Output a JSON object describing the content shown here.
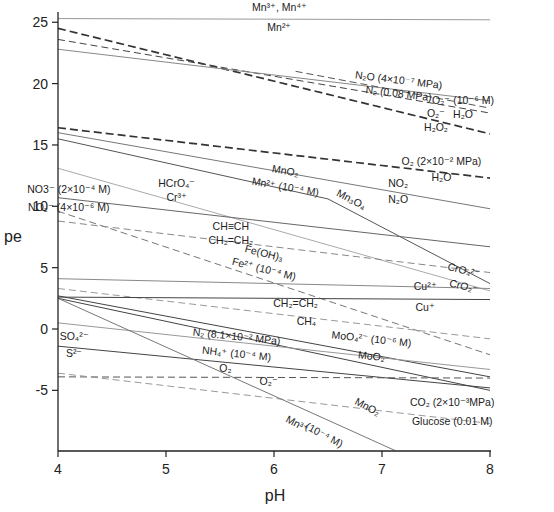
{
  "chart_data": {
    "type": "line",
    "title": "",
    "xlabel": "pH",
    "ylabel": "pe",
    "xlim": [
      4,
      8
    ],
    "ylim": [
      -9.9,
      25.8
    ],
    "xticks": [
      4,
      5,
      6,
      7,
      8
    ],
    "yticks": [
      -5,
      0,
      5,
      10,
      15,
      20,
      25
    ],
    "grid": false,
    "legend": "none (inline labels)",
    "series": [
      {
        "name": "Mn3+, Mn4+ / Mn2+",
        "style": "solid",
        "color": "#999999",
        "points": [
          [
            4,
            25.3
          ],
          [
            8,
            25.2
          ]
        ]
      },
      {
        "name": "O2 / H2O2",
        "style": "dash-thick",
        "color": "#333333",
        "points": [
          [
            4,
            24.5
          ],
          [
            8,
            15.9
          ]
        ]
      },
      {
        "name": "N2 (0.08 MPa)",
        "style": "dash",
        "color": "#444444",
        "points": [
          [
            4,
            23.6
          ],
          [
            8,
            17.6
          ]
        ]
      },
      {
        "name": "N2O (4x10^-7 MPa)",
        "style": "solid",
        "color": "#888888",
        "points": [
          [
            4,
            22.8
          ],
          [
            8,
            18.6
          ]
        ]
      },
      {
        "name": "O2- (10^-6 M) / H2O",
        "style": "dash",
        "color": "#555555",
        "points": [
          [
            6.2,
            21.0
          ],
          [
            8,
            18.0
          ]
        ]
      },
      {
        "name": "O2 (2x10^-2 MPa) / H2O",
        "style": "dash-thick",
        "color": "#333333",
        "points": [
          [
            4,
            16.4
          ],
          [
            8,
            12.3
          ]
        ]
      },
      {
        "name": "NO2 / N2O",
        "style": "solid",
        "color": "#777777",
        "points": [
          [
            4,
            16.0
          ],
          [
            8,
            9.8
          ]
        ]
      },
      {
        "name": "MnO2 / Mn2+ (10^-4 M)",
        "style": "solid",
        "color": "#555555",
        "points": [
          [
            4,
            15.5
          ],
          [
            6.5,
            10.6
          ]
        ]
      },
      {
        "name": "Mn3O4",
        "style": "solid",
        "color": "#555555",
        "points": [
          [
            6.5,
            10.6
          ],
          [
            8,
            3.7
          ]
        ]
      },
      {
        "name": "HCrO4- / Cr3+",
        "style": "solid",
        "color": "#aaaaaa",
        "points": [
          [
            4,
            13.1
          ],
          [
            8,
            3.1
          ]
        ]
      },
      {
        "name": "NO3- (2x10^-4 M)",
        "style": "solid",
        "color": "#666666",
        "points": [
          [
            4,
            10.7
          ],
          [
            8,
            6.7
          ]
        ]
      },
      {
        "name": "NO2- (4x10^-6 M)",
        "style": "dash",
        "color": "#777777",
        "points": [
          [
            4,
            9.6
          ],
          [
            8,
            -2.1
          ]
        ]
      },
      {
        "name": "CH≡CH / CH2=CH2",
        "style": "dash",
        "color": "#888888",
        "points": [
          [
            4,
            8.8
          ],
          [
            8,
            4.6
          ]
        ]
      },
      {
        "name": "CrO4 2- / CrO2-",
        "style": "solid",
        "color": "#888888",
        "points": [
          [
            4,
            4.1
          ],
          [
            8,
            3.3
          ]
        ]
      },
      {
        "name": "Fe(OH)3 / Fe2+ (10^-4 M)",
        "style": "dash",
        "color": "#999999",
        "points": [
          [
            4,
            3.3
          ],
          [
            8,
            -0.8
          ]
        ]
      },
      {
        "name": "Cu2+ / Cu+",
        "style": "solid",
        "color": "#444444",
        "points": [
          [
            4,
            2.6
          ],
          [
            8,
            2.4
          ]
        ]
      },
      {
        "name": "CH2=CH2 / CH4",
        "style": "solid",
        "color": "#444444",
        "points": [
          [
            4,
            2.7
          ],
          [
            8,
            -3.9
          ]
        ]
      },
      {
        "name": "MoO4 2- (10^-6 M) / MoO2",
        "style": "solid",
        "color": "#444444",
        "points": [
          [
            4,
            2.5
          ],
          [
            8,
            -5.0
          ]
        ]
      },
      {
        "name": "N2 (8.1x10^-2 MPa) / NH4+ (10^-4 M)",
        "style": "solid",
        "color": "#999999",
        "points": [
          [
            4,
            0.5
          ],
          [
            8,
            -3.3
          ]
        ]
      },
      {
        "name": "SO4 2- / S2-",
        "style": "solid",
        "color": "#444444",
        "points": [
          [
            4,
            -1.4
          ],
          [
            8,
            -4.8
          ]
        ]
      },
      {
        "name": "O2 / O2-",
        "style": "dash",
        "color": "#555555",
        "points": [
          [
            4,
            -3.9
          ],
          [
            8,
            -4.0
          ]
        ]
      },
      {
        "name": "CO2 (2x10^-3 MPa) / Glucose (0.01 M)",
        "style": "dash",
        "color": "#999999",
        "points": [
          [
            4,
            -3.6
          ],
          [
            8,
            -7.7
          ]
        ]
      },
      {
        "name": "MnO2 / Mn3+ (10^-4 M)",
        "style": "solid",
        "color": "#777777",
        "points": [
          [
            4,
            2.5
          ],
          [
            7.12,
            -9.9
          ]
        ]
      }
    ],
    "annotations": [
      {
        "text": "Mn³⁺, Mn⁴⁺",
        "x": 6.05,
        "y": 25.9
      },
      {
        "text": "Mn²⁺",
        "x": 6.05,
        "y": 24.3
      },
      {
        "text": "N₂O (4×10⁻⁷ MPa)",
        "x": 7.15,
        "y": 20.0,
        "rot": 7
      },
      {
        "text": "N₂ (0.08 MPa)",
        "x": 7.15,
        "y": 18.9,
        "rot": 7
      },
      {
        "text": "O₂⁻ (10⁻⁶ M)",
        "x": 7.75,
        "y": 18.3
      },
      {
        "text": "H₂O",
        "x": 7.75,
        "y": 17.2
      },
      {
        "text": "O₂⁻",
        "x": 7.5,
        "y": 17.3
      },
      {
        "text": "H₂O₂",
        "x": 7.5,
        "y": 16.1
      },
      {
        "text": "O₂ (2×10⁻² MPa)",
        "x": 7.55,
        "y": 13.4
      },
      {
        "text": "H₂O",
        "x": 7.55,
        "y": 12.1
      },
      {
        "text": "NO₂",
        "x": 7.15,
        "y": 11.6
      },
      {
        "text": "N₂O",
        "x": 7.15,
        "y": 10.3
      },
      {
        "text": "MnO₂",
        "x": 6.1,
        "y": 12.6,
        "rot": 10
      },
      {
        "text": "Mn²⁺ (10⁻⁴ M)",
        "x": 6.1,
        "y": 11.3,
        "rot": 10
      },
      {
        "text": "Mn₃O₄",
        "x": 6.7,
        "y": 10.3,
        "rot": 28
      },
      {
        "text": "HCrO₄⁻",
        "x": 5.1,
        "y": 11.6
      },
      {
        "text": "Cr³⁺",
        "x": 5.1,
        "y": 10.4
      },
      {
        "text": "NO3⁻ (2×10⁻⁴ M)",
        "x": 4.1,
        "y": 11.1
      },
      {
        "text": "NO₂⁻ (4×10⁻⁶ M)",
        "x": 4.1,
        "y": 9.6
      },
      {
        "text": "CH≡CH",
        "x": 5.6,
        "y": 8.1
      },
      {
        "text": "CH₂=CH₂",
        "x": 5.6,
        "y": 6.9
      },
      {
        "text": "Fe(OH)₃",
        "x": 5.9,
        "y": 5.9,
        "rot": 14
      },
      {
        "text": "Fe²⁺ (10⁻⁴ M)",
        "x": 5.9,
        "y": 4.6,
        "rot": 14
      },
      {
        "text": "CrO₄²⁻",
        "x": 7.75,
        "y": 4.5,
        "rot": 14
      },
      {
        "text": "CrO₂⁻",
        "x": 7.75,
        "y": 3.2,
        "rot": 14
      },
      {
        "text": "Cu²⁺",
        "x": 7.4,
        "y": 3.2
      },
      {
        "text": "Cu⁺",
        "x": 7.4,
        "y": 1.5
      },
      {
        "text": "CH₂=CH₂",
        "x": 6.2,
        "y": 1.8
      },
      {
        "text": "CH₄",
        "x": 6.3,
        "y": 0.3
      },
      {
        "text": "N₂ (8.1×10⁻² MPa)",
        "x": 5.65,
        "y": -0.9,
        "rot": 6
      },
      {
        "text": "NH₄⁺ (10⁻⁴ M)",
        "x": 5.65,
        "y": -2.3,
        "rot": 6
      },
      {
        "text": "MoO₄²⁻ (10⁻⁶ M)",
        "x": 6.9,
        "y": -1.1,
        "rot": 6
      },
      {
        "text": "MoO₂",
        "x": 6.9,
        "y": -2.5,
        "rot": 6
      },
      {
        "text": "SO₄²⁻",
        "x": 4.15,
        "y": -0.9
      },
      {
        "text": "S²⁻",
        "x": 4.15,
        "y": -2.3
      },
      {
        "text": "O₂",
        "x": 5.55,
        "y": -3.5
      },
      {
        "text": "O₂⁻",
        "x": 5.95,
        "y": -4.6
      },
      {
        "text": "CO₂ (2×10⁻³MPa)",
        "x": 7.65,
        "y": -6.3
      },
      {
        "text": "Glucose (0.01 M)",
        "x": 7.65,
        "y": -7.8
      },
      {
        "text": "MnO₂",
        "x": 6.85,
        "y": -6.6,
        "rot": 28
      },
      {
        "text": "Mn³⁺",
        "x": 6.2,
        "y": -8.0,
        "rot": 28
      },
      {
        "text": "(10⁻⁴ M)",
        "x": 6.45,
        "y": -8.9,
        "rot": 28
      }
    ]
  }
}
